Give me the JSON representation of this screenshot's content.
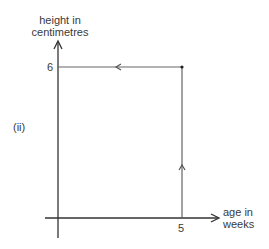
{
  "diagram": {
    "part_label": "(ii)",
    "y_axis": {
      "label_line1": "height in",
      "label_line2": "centimetres",
      "tick_label": "6",
      "tick_value": 6
    },
    "x_axis": {
      "label_line1": "age in",
      "label_line2": "weeks",
      "tick_label": "5",
      "tick_value": 5
    },
    "path": {
      "points": [
        [
          5,
          0
        ],
        [
          5,
          6
        ],
        [
          0,
          6
        ]
      ],
      "direction": "up along age=5 then left along height=6",
      "marker_point": [
        5,
        6
      ]
    },
    "colors": {
      "line": "#555555",
      "axis": "#333333"
    }
  }
}
